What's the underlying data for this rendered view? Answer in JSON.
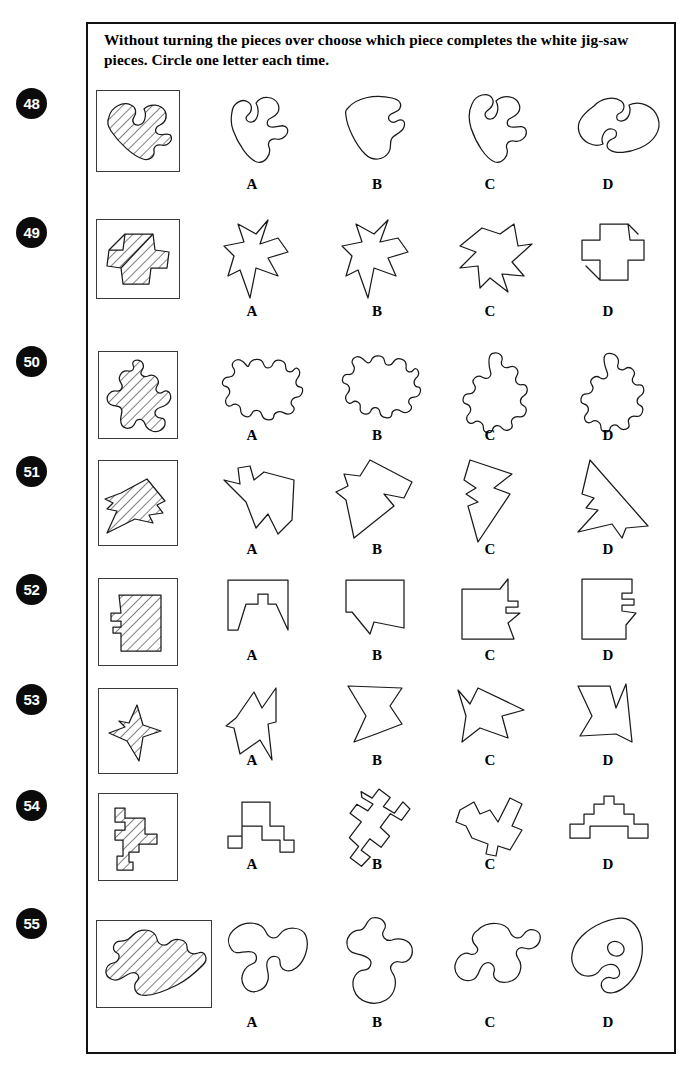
{
  "page": {
    "width": 697,
    "height": 1076,
    "background": "#ffffff",
    "border_color": "#111111"
  },
  "instructions": {
    "line1": "Without turning the pieces over choose which piece completes the white jig-saw",
    "line2": "pieces. Circle one letter each time.",
    "full": "Without turning the pieces over choose which piece completes the white jig-saw pieces. Circle one letter each time."
  },
  "option_letters": [
    "A",
    "B",
    "C",
    "D"
  ],
  "questions": [
    {
      "number": "48",
      "stimulus_name": "hatched-jigsaw-piece-48",
      "stimulus_description": "diagonally hatched jig-saw piece with one tab right and one blank notch top",
      "options": [
        {
          "letter": "A",
          "name": "option-shape-48-a"
        },
        {
          "letter": "B",
          "name": "option-shape-48-b"
        },
        {
          "letter": "C",
          "name": "option-shape-48-c"
        },
        {
          "letter": "D",
          "name": "option-shape-48-d"
        }
      ]
    },
    {
      "number": "49",
      "stimulus_name": "hatched-jigsaw-piece-49",
      "stimulus_description": "diagonally hatched cross / plus shaped piece",
      "options": [
        {
          "letter": "A",
          "name": "option-shape-49-a"
        },
        {
          "letter": "B",
          "name": "option-shape-49-b"
        },
        {
          "letter": "C",
          "name": "option-shape-49-c"
        },
        {
          "letter": "D",
          "name": "option-shape-49-d"
        }
      ]
    },
    {
      "number": "50",
      "stimulus_name": "hatched-jigsaw-piece-50",
      "stimulus_description": "diagonally hatched tall knobbly jig-saw piece",
      "options": [
        {
          "letter": "A",
          "name": "option-shape-50-a"
        },
        {
          "letter": "B",
          "name": "option-shape-50-b"
        },
        {
          "letter": "C",
          "name": "option-shape-50-c"
        },
        {
          "letter": "D",
          "name": "option-shape-50-d"
        }
      ]
    },
    {
      "number": "51",
      "stimulus_name": "hatched-jigsaw-piece-51",
      "stimulus_description": "diagonally hatched angular dart / arrow polygon",
      "options": [
        {
          "letter": "A",
          "name": "option-shape-51-a"
        },
        {
          "letter": "B",
          "name": "option-shape-51-b"
        },
        {
          "letter": "C",
          "name": "option-shape-51-c"
        },
        {
          "letter": "D",
          "name": "option-shape-51-d"
        }
      ]
    },
    {
      "number": "52",
      "stimulus_name": "hatched-jigsaw-piece-52",
      "stimulus_description": "diagonally hatched rectangular block with stepped notch on left",
      "options": [
        {
          "letter": "A",
          "name": "option-shape-52-a"
        },
        {
          "letter": "B",
          "name": "option-shape-52-b"
        },
        {
          "letter": "C",
          "name": "option-shape-52-c"
        },
        {
          "letter": "D",
          "name": "option-shape-52-d"
        }
      ]
    },
    {
      "number": "53",
      "stimulus_name": "hatched-jigsaw-piece-53",
      "stimulus_description": "diagonally hatched four pointed star / arrowhead shape",
      "options": [
        {
          "letter": "A",
          "name": "option-shape-53-a"
        },
        {
          "letter": "B",
          "name": "option-shape-53-b"
        },
        {
          "letter": "C",
          "name": "option-shape-53-c"
        },
        {
          "letter": "D",
          "name": "option-shape-53-d"
        }
      ]
    },
    {
      "number": "54",
      "stimulus_name": "hatched-jigsaw-piece-54",
      "stimulus_description": "diagonally hatched rectilinear stepped tetris-like shape",
      "options": [
        {
          "letter": "A",
          "name": "option-shape-54-a"
        },
        {
          "letter": "B",
          "name": "option-shape-54-b"
        },
        {
          "letter": "C",
          "name": "option-shape-54-c"
        },
        {
          "letter": "D",
          "name": "option-shape-54-d"
        }
      ]
    },
    {
      "number": "55",
      "stimulus_name": "hatched-jigsaw-piece-55",
      "stimulus_description": "diagonally hatched wide curved two-lobed jig-saw piece",
      "options": [
        {
          "letter": "A",
          "name": "option-shape-55-a"
        },
        {
          "letter": "B",
          "name": "option-shape-55-b"
        },
        {
          "letter": "C",
          "name": "option-shape-55-c"
        },
        {
          "letter": "D",
          "name": "option-shape-55-d"
        }
      ]
    }
  ]
}
